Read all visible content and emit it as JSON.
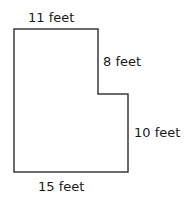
{
  "diagram": {
    "type": "composite-shape",
    "shape": "L-shaped polygon (rectangle with top-right corner removed)",
    "stroke_color": "#3a3a3a",
    "labels": {
      "top": "11 feet",
      "right_upper": "8 feet",
      "right_lower": "10 feet",
      "bottom": "15 feet"
    },
    "dimensions_ft": {
      "top_width": 11,
      "upper_right_height": 8,
      "lower_right_height": 10,
      "bottom_width": 15
    }
  }
}
